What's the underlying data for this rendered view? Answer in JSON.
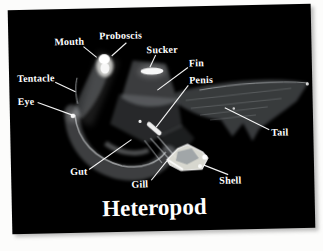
{
  "figure": {
    "title": "Heteropod",
    "background_color": "#000000",
    "page_color": "#fcfcfb",
    "label_color": "#ffffff",
    "labels": [
      {
        "part": "mouth",
        "text": "Mouth"
      },
      {
        "part": "proboscis",
        "text": "Proboscis"
      },
      {
        "part": "sucker",
        "text": "Sucker"
      },
      {
        "part": "fin",
        "text": "Fin"
      },
      {
        "part": "penis",
        "text": "Penis"
      },
      {
        "part": "tentacle",
        "text": "Tentacle"
      },
      {
        "part": "eye",
        "text": "Eye"
      },
      {
        "part": "tail",
        "text": "Tail"
      },
      {
        "part": "gut",
        "text": "Gut"
      },
      {
        "part": "gill",
        "text": "Gill"
      },
      {
        "part": "shell",
        "text": "Shell"
      }
    ]
  }
}
